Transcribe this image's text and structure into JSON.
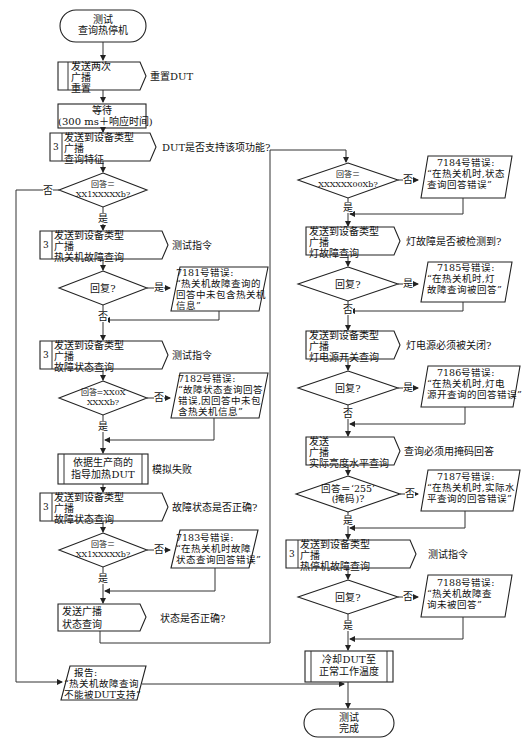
{
  "diagram": {
    "type": "flowchart",
    "start": {
      "line1": "测试",
      "line2": "查询热停机"
    },
    "end": {
      "line1": "测试",
      "line2": "完成"
    },
    "yes": "是",
    "no": "否",
    "nodes": {
      "n1": {
        "lines": [
          "发送两次",
          "广播",
          "重置"
        ],
        "note": "重置DUT"
      },
      "n2": {
        "lines": [
          "等待",
          "(300 ms＋响应时间)"
        ]
      },
      "n3": {
        "prefix": "3",
        "lines": [
          "发送到设备类型",
          "广播",
          "查询特征"
        ],
        "note": "DUT是否支持该项功能?"
      },
      "d1": {
        "lines": [
          "回答＝",
          "XX1XXXXXb?"
        ]
      },
      "n4": {
        "prefix": "3",
        "lines": [
          "发送到设备类型",
          "广播",
          "热关机故障查询"
        ],
        "note": "测试指令"
      },
      "d2": {
        "lines": [
          "回复?"
        ]
      },
      "e7181": {
        "lines": [
          "7181号错误:",
          "“热关机故障查询的",
          "回答中未包含热关机",
          "信息”"
        ]
      },
      "n5": {
        "prefix": "3",
        "lines": [
          "发送到设备类型",
          "广播",
          "故障状态查询"
        ],
        "note": "测试指令"
      },
      "d3": {
        "lines": [
          "回答=XX0X",
          "XXXXb?"
        ]
      },
      "e7182": {
        "lines": [
          "7182号错误:",
          "“故障状态查询回答",
          "错误,因回答中未包",
          "含热关机信息”"
        ]
      },
      "n6": {
        "lines": [
          "依据生产商的",
          "指导加热DUT"
        ],
        "note": "模拟失败"
      },
      "n7": {
        "prefix": "3",
        "lines": [
          "发送到设备类型",
          "广播",
          "故障状态查询"
        ],
        "note": "故障状态是否正确?"
      },
      "d4": {
        "lines": [
          "回答＝",
          "XX1XXXXXb?"
        ]
      },
      "e7183": {
        "lines": [
          "7183号错误:",
          "“在热关机时故障",
          "状态查询回答错误”"
        ]
      },
      "n8": {
        "lines": [
          "发送广播",
          "状态查询"
        ],
        "note": "状态是否正确?"
      },
      "report": {
        "lines": [
          "报告:",
          "“热关机故障查询",
          "不能被DUT支持”"
        ]
      },
      "d5": {
        "lines": [
          "回答＝",
          "XXXXXX00Xb?"
        ]
      },
      "e7184": {
        "lines": [
          "7184号错误:",
          "“在热关机时,状态",
          "查询回答错误”"
        ]
      },
      "n9": {
        "lines": [
          "发送到设备类型",
          "广播",
          "灯故障查询"
        ],
        "note": "灯故障是否被检测到?"
      },
      "d6": {
        "lines": [
          "回复?"
        ]
      },
      "e7185": {
        "lines": [
          "7185号错误:",
          "“在热关机时,灯",
          "故障查询被回答”"
        ]
      },
      "n10": {
        "lines": [
          "发送到设备类型",
          "广播",
          "灯电源开关查询"
        ],
        "note": "灯电源必须被关闭?"
      },
      "d7": {
        "lines": [
          "回复?"
        ]
      },
      "e7186": {
        "lines": [
          "7186号错误:",
          "“在热关机时,灯电",
          "源开查询的回答错误”"
        ]
      },
      "n11": {
        "lines": [
          "发送",
          "广播",
          "实际亮度水平查询"
        ],
        "note": "查询必须用掩码回答"
      },
      "d8": {
        "lines": [
          "回答＝‘255’",
          "(掩码)?"
        ]
      },
      "e7187": {
        "lines": [
          "7187号错误:",
          "“在热关机时,实际水",
          "平查询的回答错误”"
        ]
      },
      "n12": {
        "prefix": "3",
        "lines": [
          "发送到设备类型",
          "广播",
          "热停机故障查询"
        ],
        "note": "测试指令"
      },
      "d9": {
        "lines": [
          "回复?"
        ]
      },
      "e7188": {
        "lines": [
          "7188号错误:",
          "“热关机故障查",
          "询未被回答”"
        ]
      },
      "n13": {
        "lines": [
          "冷却DUT至",
          "正常工作温度"
        ]
      }
    }
  }
}
